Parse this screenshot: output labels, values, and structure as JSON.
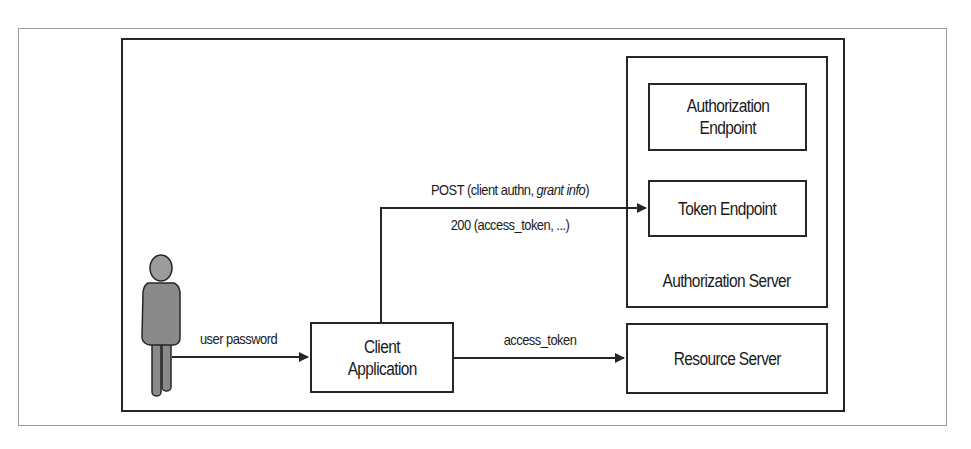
{
  "diagram": {
    "type": "oauth2-resource-owner-password-credentials-flow",
    "actors": {
      "user": {
        "icon": "person-icon"
      },
      "client": {
        "label_line1": "Client",
        "label_line2": "Application"
      },
      "authorization_server": {
        "label": "Authorization Server"
      },
      "authorization_endpoint": {
        "label_line1": "Authorization",
        "label_line2": "Endpoint"
      },
      "token_endpoint": {
        "label": "Token Endpoint"
      },
      "resource_server": {
        "label": "Resource Server"
      }
    },
    "edges": {
      "user_to_client": {
        "label": "user password"
      },
      "client_to_token": {
        "label_prefix": "POST (client authn, ",
        "label_italic": "grant info",
        "label_suffix": ")"
      },
      "token_to_client": {
        "label": "200 (access_token, ...)"
      },
      "client_to_resource": {
        "label": "access_token"
      }
    },
    "colors": {
      "stroke": "#262626",
      "person_body": "#8a8a8a",
      "person_head": "#9c9c9c",
      "frame": "#9a9a9a"
    }
  }
}
